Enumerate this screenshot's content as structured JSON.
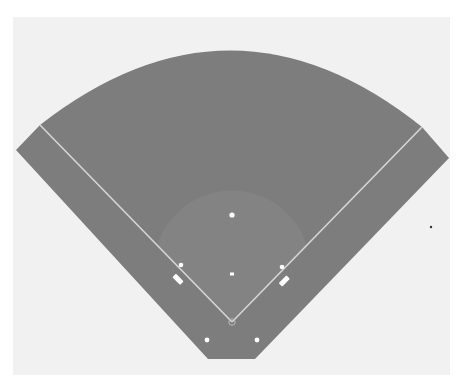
{
  "diagram": {
    "type": "baseball-field",
    "title_partial": "",
    "colors": {
      "background": "#ffffff",
      "panel": "#f1f1f1",
      "field": "#7d7d7d",
      "infield_dirt": "#838383",
      "lines": "#d6d6d6",
      "markers": "#ffffff",
      "stray_dot": "#333333"
    },
    "elements": {
      "home_plate": {
        "x": 232,
        "y": 322
      },
      "first_base": {
        "x": 282,
        "y": 267
      },
      "second_base": {
        "x": 232,
        "y": 215
      },
      "third_base": {
        "x": 181,
        "y": 265
      },
      "pitchers_mound": {
        "x": 232,
        "y": 274
      },
      "left_coach_box": {
        "x": 178,
        "y": 280
      },
      "right_coach_box": {
        "x": 285,
        "y": 281
      },
      "on_deck_left": {
        "x": 207,
        "y": 340
      },
      "on_deck_right": {
        "x": 257,
        "y": 340
      },
      "left_foul_pole": {
        "x": 40,
        "y": 125
      },
      "right_foul_pole": {
        "x": 422,
        "y": 127
      },
      "stray_dot": {
        "x": 431,
        "y": 227
      }
    }
  }
}
